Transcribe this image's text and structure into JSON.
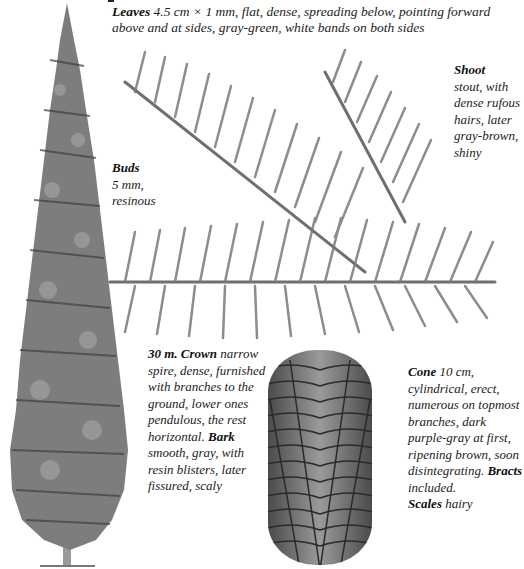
{
  "leaves": {
    "label": "Leaves",
    "text": "4.5 cm × 1 mm, flat, dense, spreading below, pointing forward above and at sides, gray-green, white bands on both sides"
  },
  "shoot": {
    "label": "Shoot",
    "text": "stout, with dense rufous hairs, later gray-brown, shiny"
  },
  "buds": {
    "label": "Buds",
    "text": "5 mm, resinous"
  },
  "crown": {
    "label": "30 m. Crown",
    "text": "narrow spire, dense, furnished with branches to the ground, lower ones pendulous, the rest horizontal."
  },
  "bark": {
    "label": "Bark",
    "text": "smooth, gray, with resin blisters, later fissured, scaly"
  },
  "cone": {
    "label": "Cone",
    "text": "10 cm, cylindrical, erect, numerous on topmost branches, dark purple-gray at first, ripening brown, soon disintegrating."
  },
  "bracts": {
    "label": "Bracts",
    "text": "included."
  },
  "scales": {
    "label": "Scales",
    "text": "hairy"
  },
  "illustrations": {
    "tree": "tree-illustration",
    "shoot": "shoot-illustration",
    "cone": "cone-illustration"
  },
  "colors": {
    "foliage": "#6f6f6f",
    "foliage_dark": "#3f3f3f",
    "cone": "#7a7a7a",
    "cone_lines": "#2a2a2a"
  }
}
